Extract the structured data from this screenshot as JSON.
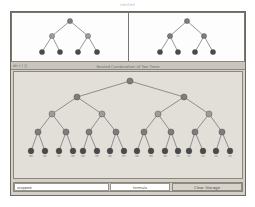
{
  "window": {
    "title": "nested"
  },
  "caption": {
    "left_text": "dir (-) []",
    "center_title": "Nested Combination of Two Trees"
  },
  "bottom_bar": {
    "status_label": "stopped",
    "formula_label": "formula",
    "action_button_label": "Clear Storage"
  },
  "colors": {
    "window_bg": "#d4d0c8",
    "panel_bg": "#fdfdfd",
    "canvas_bg": "#e2dfd8",
    "node_dark": "#4a4a4a",
    "node_mid": "#7d7d7d",
    "node_light": "#9c9c9c",
    "edge": "#6b6b6b",
    "border": "#8b8780"
  },
  "left_tree": {
    "name": "Tree A",
    "levels": 3,
    "nodes": [
      {
        "id": "a0",
        "level": 0,
        "x": 58,
        "y": 8,
        "shade": "node_mid"
      },
      {
        "id": "a1",
        "level": 1,
        "x": 40,
        "y": 23,
        "shade": "node_light"
      },
      {
        "id": "a2",
        "level": 1,
        "x": 76,
        "y": 23,
        "shade": "node_light"
      },
      {
        "id": "a3",
        "level": 2,
        "x": 30,
        "y": 39,
        "shade": "node_dark"
      },
      {
        "id": "a4",
        "level": 2,
        "x": 48,
        "y": 39,
        "shade": "node_dark"
      },
      {
        "id": "a5",
        "level": 2,
        "x": 66,
        "y": 39,
        "shade": "node_dark"
      },
      {
        "id": "a6",
        "level": 2,
        "x": 85,
        "y": 39,
        "shade": "node_dark"
      }
    ],
    "edges": [
      [
        "a0",
        "a1"
      ],
      [
        "a0",
        "a2"
      ],
      [
        "a1",
        "a3"
      ],
      [
        "a1",
        "a4"
      ],
      [
        "a2",
        "a5"
      ],
      [
        "a2",
        "a6"
      ]
    ]
  },
  "right_tree": {
    "name": "Tree B",
    "levels": 3,
    "nodes": [
      {
        "id": "b0",
        "level": 0,
        "x": 58,
        "y": 8,
        "shade": "node_mid"
      },
      {
        "id": "b1",
        "level": 1,
        "x": 41,
        "y": 23,
        "shade": "node_mid"
      },
      {
        "id": "b2",
        "level": 1,
        "x": 75,
        "y": 23,
        "shade": "node_mid"
      },
      {
        "id": "b3",
        "level": 2,
        "x": 31,
        "y": 39,
        "shade": "node_dark"
      },
      {
        "id": "b4",
        "level": 2,
        "x": 49,
        "y": 39,
        "shade": "node_dark"
      },
      {
        "id": "b5",
        "level": 2,
        "x": 66,
        "y": 39,
        "shade": "node_dark"
      },
      {
        "id": "b6",
        "level": 2,
        "x": 84,
        "y": 39,
        "shade": "node_dark"
      }
    ],
    "edges": [
      [
        "b0",
        "b1"
      ],
      [
        "b0",
        "b2"
      ],
      [
        "b1",
        "b3"
      ],
      [
        "b1",
        "b4"
      ],
      [
        "b2",
        "b5"
      ],
      [
        "b2",
        "b6"
      ]
    ]
  },
  "main_tree": {
    "name": "Nested Combination",
    "levels": 5,
    "leaf_count": 16,
    "leaf_labels": [
      "00",
      "01",
      "02",
      "03",
      "04",
      "05",
      "06",
      "07",
      "08",
      "09",
      "10",
      "11",
      "12",
      "13",
      "14",
      "15"
    ],
    "nodes": [
      {
        "id": "n0",
        "level": 0,
        "x": 116,
        "y": 9,
        "shade": "node_mid"
      },
      {
        "id": "n1",
        "level": 1,
        "x": 63,
        "y": 25,
        "shade": "node_mid"
      },
      {
        "id": "n2",
        "level": 1,
        "x": 170,
        "y": 25,
        "shade": "node_mid"
      },
      {
        "id": "n3",
        "level": 2,
        "x": 38,
        "y": 42,
        "shade": "node_light"
      },
      {
        "id": "n4",
        "level": 2,
        "x": 88,
        "y": 42,
        "shade": "node_light"
      },
      {
        "id": "n5",
        "level": 2,
        "x": 144,
        "y": 42,
        "shade": "node_light"
      },
      {
        "id": "n6",
        "level": 2,
        "x": 195,
        "y": 42,
        "shade": "node_light"
      },
      {
        "id": "n7",
        "level": 3,
        "x": 24,
        "y": 60,
        "shade": "node_mid"
      },
      {
        "id": "n8",
        "level": 3,
        "x": 52,
        "y": 60,
        "shade": "node_mid"
      },
      {
        "id": "n9",
        "level": 3,
        "x": 75,
        "y": 60,
        "shade": "node_mid"
      },
      {
        "id": "n10",
        "level": 3,
        "x": 102,
        "y": 60,
        "shade": "node_mid"
      },
      {
        "id": "n11",
        "level": 3,
        "x": 130,
        "y": 60,
        "shade": "node_mid"
      },
      {
        "id": "n12",
        "level": 3,
        "x": 157,
        "y": 60,
        "shade": "node_mid"
      },
      {
        "id": "n13",
        "level": 3,
        "x": 181,
        "y": 60,
        "shade": "node_mid"
      },
      {
        "id": "n14",
        "level": 3,
        "x": 208,
        "y": 60,
        "shade": "node_mid"
      },
      {
        "id": "l0",
        "level": 4,
        "x": 17,
        "y": 79,
        "shade": "node_dark"
      },
      {
        "id": "l1",
        "level": 4,
        "x": 31,
        "y": 79,
        "shade": "node_dark"
      },
      {
        "id": "l2",
        "level": 4,
        "x": 45,
        "y": 79,
        "shade": "node_dark"
      },
      {
        "id": "l3",
        "level": 4,
        "x": 59,
        "y": 79,
        "shade": "node_dark"
      },
      {
        "id": "l4",
        "level": 4,
        "x": 69,
        "y": 79,
        "shade": "node_dark"
      },
      {
        "id": "l5",
        "level": 4,
        "x": 83,
        "y": 79,
        "shade": "node_dark"
      },
      {
        "id": "l6",
        "level": 4,
        "x": 96,
        "y": 79,
        "shade": "node_dark"
      },
      {
        "id": "l7",
        "level": 4,
        "x": 110,
        "y": 79,
        "shade": "node_dark"
      },
      {
        "id": "l8",
        "level": 4,
        "x": 123,
        "y": 79,
        "shade": "node_dark"
      },
      {
        "id": "l9",
        "level": 4,
        "x": 137,
        "y": 79,
        "shade": "node_dark"
      },
      {
        "id": "l10",
        "level": 4,
        "x": 151,
        "y": 79,
        "shade": "node_dark"
      },
      {
        "id": "l11",
        "level": 4,
        "x": 164,
        "y": 79,
        "shade": "node_dark"
      },
      {
        "id": "l12",
        "level": 4,
        "x": 175,
        "y": 79,
        "shade": "node_dark"
      },
      {
        "id": "l13",
        "level": 4,
        "x": 189,
        "y": 79,
        "shade": "node_dark"
      },
      {
        "id": "l14",
        "level": 4,
        "x": 202,
        "y": 79,
        "shade": "node_dark"
      },
      {
        "id": "l15",
        "level": 4,
        "x": 216,
        "y": 79,
        "shade": "node_dark"
      }
    ],
    "edges": [
      [
        "n0",
        "n1"
      ],
      [
        "n0",
        "n2"
      ],
      [
        "n1",
        "n3"
      ],
      [
        "n1",
        "n4"
      ],
      [
        "n2",
        "n5"
      ],
      [
        "n2",
        "n6"
      ],
      [
        "n3",
        "n7"
      ],
      [
        "n3",
        "n8"
      ],
      [
        "n4",
        "n9"
      ],
      [
        "n4",
        "n10"
      ],
      [
        "n5",
        "n11"
      ],
      [
        "n5",
        "n12"
      ],
      [
        "n6",
        "n13"
      ],
      [
        "n6",
        "n14"
      ],
      [
        "n7",
        "l0"
      ],
      [
        "n7",
        "l1"
      ],
      [
        "n8",
        "l2"
      ],
      [
        "n8",
        "l3"
      ],
      [
        "n9",
        "l4"
      ],
      [
        "n9",
        "l5"
      ],
      [
        "n10",
        "l6"
      ],
      [
        "n10",
        "l7"
      ],
      [
        "n11",
        "l8"
      ],
      [
        "n11",
        "l9"
      ],
      [
        "n12",
        "l10"
      ],
      [
        "n12",
        "l11"
      ],
      [
        "n13",
        "l12"
      ],
      [
        "n13",
        "l13"
      ],
      [
        "n14",
        "l14"
      ],
      [
        "n14",
        "l15"
      ]
    ]
  }
}
